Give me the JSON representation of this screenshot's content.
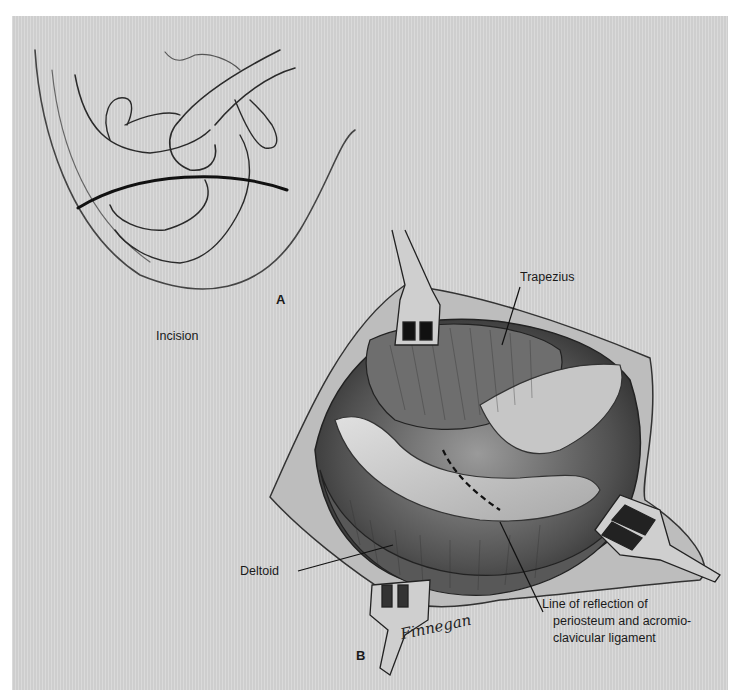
{
  "figure": {
    "panel_a": {
      "letter": "A",
      "labels": {
        "incision": "Incision"
      }
    },
    "panel_b": {
      "letter": "B",
      "labels": {
        "trapezius": "Trapezius",
        "deltoid": "Deltoid",
        "reflection_line": [
          "Line of reflection of",
          "periosteum and acromio-",
          "clavicular ligament"
        ]
      }
    },
    "signature": "Finnegan",
    "colors": {
      "background": "#d6d6d6",
      "ink": "#1a1a1a",
      "muscle_dark": "#3a3a3a",
      "muscle_mid": "#8a8a8a",
      "bone_light": "#c8c8c8"
    }
  }
}
